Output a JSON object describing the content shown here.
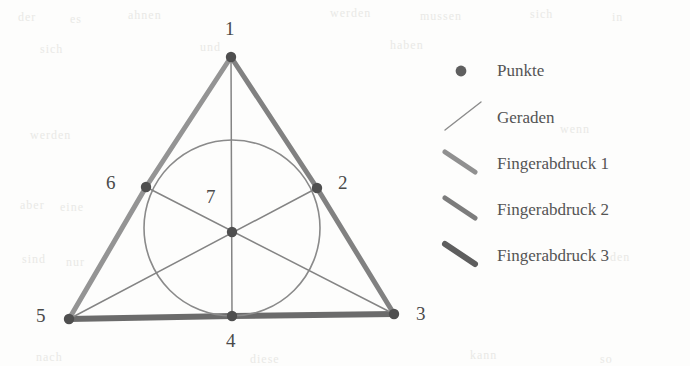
{
  "figure": {
    "type": "geometry-diagram",
    "background_color": "#fdfdfc",
    "ink_color": "#5a5a5a",
    "points": [
      {
        "id": "1",
        "label": "1",
        "x": 231,
        "y": 57,
        "label_x": 225,
        "label_y": 18
      },
      {
        "id": "2",
        "label": "2",
        "x": 317,
        "y": 188,
        "label_x": 338,
        "label_y": 172
      },
      {
        "id": "3",
        "label": "3",
        "x": 394,
        "y": 314,
        "label_x": 416,
        "label_y": 303
      },
      {
        "id": "4",
        "label": "4",
        "x": 232,
        "y": 316,
        "label_x": 226,
        "label_y": 330
      },
      {
        "id": "5",
        "label": "5",
        "x": 69,
        "y": 319,
        "label_x": 36,
        "label_y": 305
      },
      {
        "id": "6",
        "label": "6",
        "x": 146,
        "y": 187,
        "label_x": 106,
        "label_y": 172
      },
      {
        "id": "7",
        "label": "7",
        "x": 232,
        "y": 232,
        "label_x": 206,
        "label_y": 186
      }
    ],
    "circle": {
      "cx": 232,
      "cy": 228,
      "r": 88,
      "stroke": "#8a8a8a",
      "stroke_width": 1.6
    },
    "thin_lines": [
      {
        "name": "cevian-1-4",
        "from": "1",
        "to": "4"
      },
      {
        "name": "cevian-5-2",
        "from": "5",
        "to": "2"
      },
      {
        "name": "cevian-3-6",
        "from": "3",
        "to": "6"
      }
    ],
    "fingerprint_edges": [
      {
        "name": "Fingerabdruck 1",
        "from": "1",
        "to": "6",
        "to2": "5",
        "color": "#8e8e8e",
        "width": 5
      },
      {
        "name": "Fingerabdruck 2",
        "from": "1",
        "to": "2",
        "to2": "3",
        "color": "#7a7a7a",
        "width": 5
      },
      {
        "name": "Fingerabdruck 3",
        "from": "5",
        "to": "4",
        "to2": "3",
        "color": "#636363",
        "width": 6
      }
    ]
  },
  "legend": {
    "items": [
      {
        "marker": "dot-marker",
        "label": "Punkte",
        "color": "#5f5f5f",
        "width": 0
      },
      {
        "marker": "thin-line-marker",
        "label": "Geraden",
        "color": "#8c8c8c",
        "width": 1.4
      },
      {
        "marker": "thick-line-marker-1",
        "label": "Fingerabdruck 1",
        "color": "#909090",
        "width": 5
      },
      {
        "marker": "thick-line-marker-2",
        "label": "Fingerabdruck 2",
        "color": "#7c7c7c",
        "width": 5
      },
      {
        "marker": "thick-line-marker-3",
        "label": "Fingerabdruck 3",
        "color": "#5e5e5e",
        "width": 6
      }
    ]
  },
  "scan_artifacts": [
    {
      "text": "der",
      "x": 18,
      "y": 10
    },
    {
      "text": "es",
      "x": 70,
      "y": 12
    },
    {
      "text": "ahnen",
      "x": 128,
      "y": 8
    },
    {
      "text": "werden",
      "x": 330,
      "y": 6
    },
    {
      "text": "mussen",
      "x": 420,
      "y": 9
    },
    {
      "text": "sich",
      "x": 530,
      "y": 7
    },
    {
      "text": "in",
      "x": 612,
      "y": 10
    },
    {
      "text": "sich",
      "x": 40,
      "y": 42
    },
    {
      "text": "und",
      "x": 200,
      "y": 40
    },
    {
      "text": "haben",
      "x": 390,
      "y": 38
    },
    {
      "text": "werden",
      "x": 30,
      "y": 128
    },
    {
      "text": "wenn",
      "x": 560,
      "y": 122
    },
    {
      "text": "aber",
      "x": 20,
      "y": 198
    },
    {
      "text": "eine",
      "x": 60,
      "y": 200
    },
    {
      "text": "sind",
      "x": 22,
      "y": 252
    },
    {
      "text": "nur",
      "x": 66,
      "y": 255
    },
    {
      "text": "den",
      "x": 610,
      "y": 250
    },
    {
      "text": "nach",
      "x": 36,
      "y": 350
    },
    {
      "text": "diese",
      "x": 250,
      "y": 352
    },
    {
      "text": "kann",
      "x": 470,
      "y": 348
    },
    {
      "text": "so",
      "x": 600,
      "y": 352
    }
  ]
}
